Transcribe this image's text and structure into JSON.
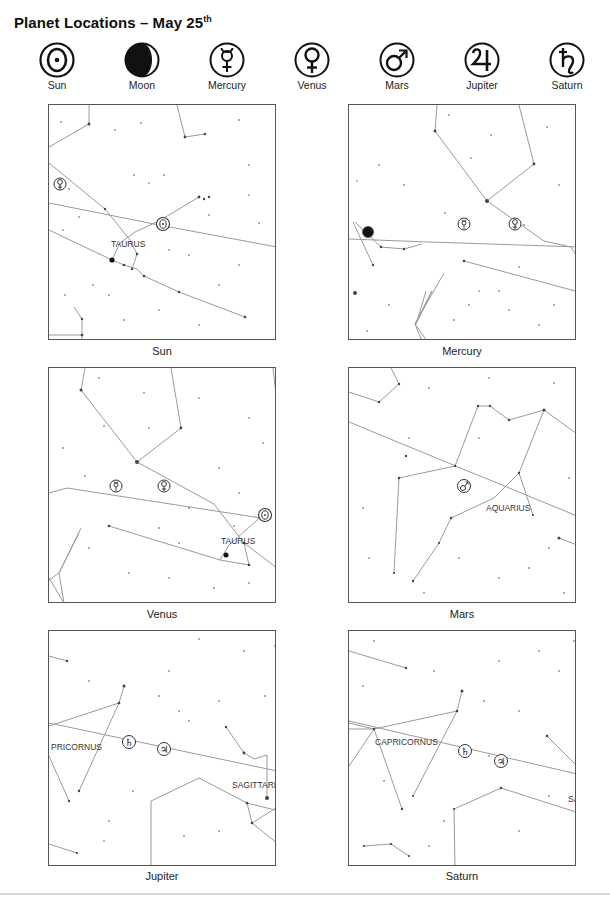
{
  "title": {
    "text": "Planet Locations – May 25",
    "suffix": "th"
  },
  "legend": [
    {
      "name": "Sun",
      "symbol": "sun-icon"
    },
    {
      "name": "Moon",
      "symbol": "moon-icon"
    },
    {
      "name": "Mercury",
      "symbol": "mercury-icon"
    },
    {
      "name": "Venus",
      "symbol": "venus-icon"
    },
    {
      "name": "Mars",
      "symbol": "mars-icon"
    },
    {
      "name": "Jupiter",
      "symbol": "jupiter-icon"
    },
    {
      "name": "Saturn",
      "symbol": "saturn-icon"
    }
  ],
  "symbols": {
    "mercury": "☿",
    "venus": "♀",
    "mars": "♂",
    "jupiter": "♃",
    "saturn": "♄"
  },
  "panels": [
    {
      "caption": "Sun",
      "constellation_labels": [
        "TAURUS"
      ]
    },
    {
      "caption": "Mercury",
      "constellation_labels": []
    },
    {
      "caption": "Venus",
      "constellation_labels": [
        "TAURUS"
      ]
    },
    {
      "caption": "Mars",
      "constellation_labels": [
        "AQUARIUS"
      ]
    },
    {
      "caption": "Jupiter",
      "constellation_labels": [
        "PRICORNUS",
        "SAGITTARI"
      ]
    },
    {
      "caption": "Saturn",
      "constellation_labels": [
        "CAPRICORNUS",
        "SA"
      ]
    }
  ],
  "colors": {
    "line": "#9a9a9a",
    "frame": "#555555",
    "star": "#444444",
    "ink": "#111111"
  }
}
